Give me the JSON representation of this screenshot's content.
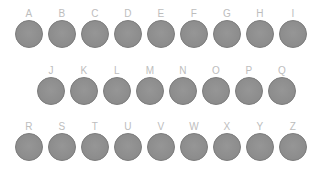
{
  "app": {
    "title": "Alphabet Key Grid",
    "background_color": "#ffffff"
  },
  "style": {
    "key_fill_color": "#8f8f8f",
    "key_border_color": "#7e7e7e",
    "label_color": "#bdbdbd"
  },
  "rows": [
    {
      "id": "row-1",
      "keys": [
        {
          "label": "A"
        },
        {
          "label": "B"
        },
        {
          "label": "C"
        },
        {
          "label": "D"
        },
        {
          "label": "E"
        },
        {
          "label": "F"
        },
        {
          "label": "G"
        },
        {
          "label": "H"
        },
        {
          "label": "I"
        }
      ]
    },
    {
      "id": "row-2",
      "keys": [
        {
          "label": "J"
        },
        {
          "label": "K"
        },
        {
          "label": "L"
        },
        {
          "label": "M"
        },
        {
          "label": "N"
        },
        {
          "label": "O"
        },
        {
          "label": "P"
        },
        {
          "label": "Q"
        }
      ]
    },
    {
      "id": "row-3",
      "keys": [
        {
          "label": "R"
        },
        {
          "label": "S"
        },
        {
          "label": "T"
        },
        {
          "label": "U"
        },
        {
          "label": "V"
        },
        {
          "label": "W"
        },
        {
          "label": "X"
        },
        {
          "label": "Y"
        },
        {
          "label": "Z"
        }
      ]
    }
  ]
}
